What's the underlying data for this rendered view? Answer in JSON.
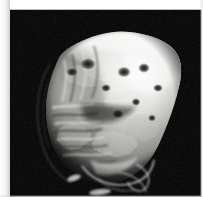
{
  "image": {
    "kind": "volumetric-render",
    "domain_note": "grayscale 3D volume rendering of an organic specimen",
    "subject": "heart-shaped nodular specimen",
    "background_color": "#030303",
    "page_color": "#ffffff",
    "frame": {
      "left_margin_px": 10,
      "top_margin_px": 10,
      "right_margin_px": 3,
      "bottom_margin_px": 2,
      "canvas_width_px": 193,
      "canvas_height_px": 187
    },
    "palette": {
      "highlight": "#f6f6f4",
      "bright": "#e2e2de",
      "midtone": "#a9a9a5",
      "shadow": "#555552",
      "deep_shadow": "#1d1d1c",
      "void": "#030303"
    },
    "lighting": {
      "key_light_direction": "upper-right",
      "fill": "low",
      "specular_zone": "top-right lobe"
    },
    "features": [
      {
        "name": "apex-crest",
        "description": "bright jagged crest along the top edge"
      },
      {
        "name": "right-lobe",
        "description": "large bright bulging lobe on the right side"
      },
      {
        "name": "left-flank",
        "description": "darker ridged flank with horizontal striations"
      },
      {
        "name": "pit-cluster",
        "description": "cluster of small dark pits across the upper surface"
      },
      {
        "name": "basal-filaments",
        "description": "thin curved filament loops trailing at the base"
      },
      {
        "name": "contour-arc",
        "description": "faint thin arc outline left of the body"
      }
    ]
  }
}
